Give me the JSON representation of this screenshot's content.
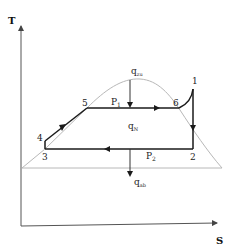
{
  "diagram": {
    "type": "T-s diagram (Clausius-Rankine cycle)",
    "axes": {
      "y_label": "T",
      "x_label": "S"
    },
    "state_points": [
      {
        "id": "1",
        "label": "1"
      },
      {
        "id": "2",
        "label": "2"
      },
      {
        "id": "3",
        "label": "3"
      },
      {
        "id": "4",
        "label": "4"
      },
      {
        "id": "5",
        "label": "5"
      },
      {
        "id": "6",
        "label": "6"
      }
    ],
    "pressures": {
      "p1": {
        "main": "P",
        "sub": "1"
      },
      "p2": {
        "main": "P",
        "sub": "2"
      }
    },
    "heat_flows": {
      "q_in": {
        "main": "q",
        "sub": "zu"
      },
      "q_net": {
        "main": "q",
        "sub": "N"
      },
      "q_out": {
        "main": "q",
        "sub": "ab"
      }
    },
    "colors": {
      "cycle": "#1a1a1a",
      "dome": "#b8b8b8",
      "axis": "#555555"
    }
  }
}
